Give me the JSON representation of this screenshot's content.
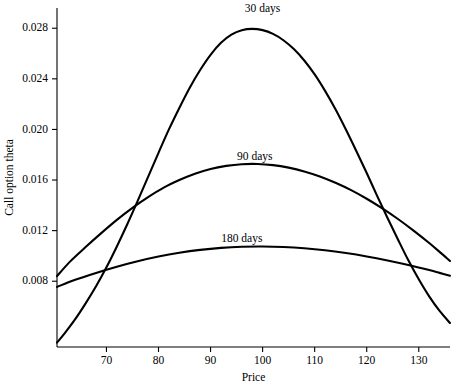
{
  "chart_data": {
    "type": "line",
    "title": "",
    "xlabel": "Price",
    "ylabel": "Call option theta",
    "xlim": [
      60.5,
      136
    ],
    "ylim": [
      0.0028,
      0.0296
    ],
    "grid": false,
    "legend_position": "inline-annotation",
    "xticks": [
      70,
      80,
      90,
      100,
      110,
      120,
      130
    ],
    "xtick_labels": [
      "70",
      "80",
      "90",
      "100",
      "110",
      "120",
      "130"
    ],
    "yticks": [
      0.008,
      0.012,
      0.016,
      0.02,
      0.024,
      0.028
    ],
    "ytick_labels": [
      "0.008",
      "0.012",
      "0.016",
      "0.020",
      "0.024",
      "0.028"
    ],
    "series": [
      {
        "name": "30 days",
        "label": "30 days",
        "label_x": 100,
        "label_y": 0.0293,
        "color": "#000000",
        "x": [
          60.5,
          62,
          64,
          66,
          68,
          70,
          72,
          74,
          76,
          78,
          80,
          82,
          84,
          86,
          88,
          90,
          92,
          94,
          96,
          98,
          100,
          102,
          104,
          106,
          108,
          110,
          112,
          114,
          116,
          118,
          120,
          122,
          124,
          126,
          128,
          130,
          132,
          134,
          136
        ],
        "values": [
          0.00315,
          0.0039,
          0.005,
          0.00625,
          0.0076,
          0.0091,
          0.01075,
          0.0125,
          0.01435,
          0.01625,
          0.01815,
          0.02,
          0.0217,
          0.0233,
          0.0247,
          0.0259,
          0.02685,
          0.0275,
          0.02785,
          0.02795,
          0.02785,
          0.02755,
          0.02705,
          0.02635,
          0.02545,
          0.02435,
          0.02305,
          0.0216,
          0.02,
          0.0183,
          0.01655,
          0.01475,
          0.013,
          0.0113,
          0.00965,
          0.00815,
          0.0068,
          0.00565,
          0.0047
        ]
      },
      {
        "name": "90 days",
        "label": "90 days",
        "label_x": 98.5,
        "label_y": 0.01755,
        "color": "#000000",
        "x": [
          60.5,
          63,
          66,
          69,
          72,
          75,
          78,
          81,
          84,
          87,
          90,
          93,
          96,
          99,
          102,
          105,
          108,
          111,
          114,
          117,
          120,
          123,
          126,
          129,
          132,
          134,
          136
        ],
        "values": [
          0.0084,
          0.00955,
          0.0107,
          0.0118,
          0.01285,
          0.0138,
          0.01465,
          0.0154,
          0.016,
          0.0165,
          0.01688,
          0.01712,
          0.01725,
          0.01727,
          0.01718,
          0.01698,
          0.01668,
          0.01628,
          0.01578,
          0.0152,
          0.01452,
          0.01376,
          0.01292,
          0.012,
          0.01102,
          0.01032,
          0.0096
        ]
      },
      {
        "name": "180 days",
        "label": "180 days",
        "label_x": 96,
        "label_y": 0.0111,
        "color": "#000000",
        "x": [
          60.5,
          64,
          68,
          72,
          76,
          80,
          84,
          88,
          92,
          96,
          100,
          104,
          108,
          112,
          116,
          120,
          124,
          128,
          132,
          134,
          136
        ],
        "values": [
          0.00755,
          0.00812,
          0.00866,
          0.00915,
          0.00958,
          0.00995,
          0.01025,
          0.01048,
          0.01064,
          0.01073,
          0.01075,
          0.01071,
          0.01061,
          0.01045,
          0.01023,
          0.00996,
          0.00964,
          0.00928,
          0.00888,
          0.00866,
          0.00843
        ]
      }
    ]
  }
}
